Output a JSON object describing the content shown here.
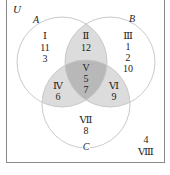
{
  "diagram": {
    "type": "venn-3",
    "universe_label": "U",
    "sets": [
      {
        "name": "A",
        "label": "A"
      },
      {
        "name": "B",
        "label": "B"
      },
      {
        "name": "C",
        "label": "C"
      }
    ],
    "regions": [
      {
        "id": "I",
        "numeral": "Ⅰ",
        "values": [
          "11",
          "3"
        ],
        "description": "A only"
      },
      {
        "id": "II",
        "numeral": "Ⅱ",
        "values": [
          "12"
        ],
        "description": "A and B only"
      },
      {
        "id": "III",
        "numeral": "Ⅲ",
        "values": [
          "1",
          "2",
          "10"
        ],
        "description": "B only"
      },
      {
        "id": "IV",
        "numeral": "Ⅳ",
        "values": [
          "6"
        ],
        "description": "A and C only"
      },
      {
        "id": "V",
        "numeral": "V",
        "values": [
          "5",
          "7"
        ],
        "description": "A, B and C"
      },
      {
        "id": "VI",
        "numeral": "Ⅵ",
        "values": [
          "9"
        ],
        "description": "B and C only"
      },
      {
        "id": "VII",
        "numeral": "Ⅶ",
        "values": [
          "8"
        ],
        "description": "C only"
      },
      {
        "id": "VIII",
        "numeral": "Ⅷ",
        "values": [
          "4"
        ],
        "description": "outside A, B, C"
      }
    ],
    "colors": {
      "frame": "#8a8a8a",
      "circle_stroke": "#c4c4c4",
      "shade_pair": "#dcdcdc",
      "shade_triple": "#b8b8b8",
      "text": "#222222"
    }
  }
}
